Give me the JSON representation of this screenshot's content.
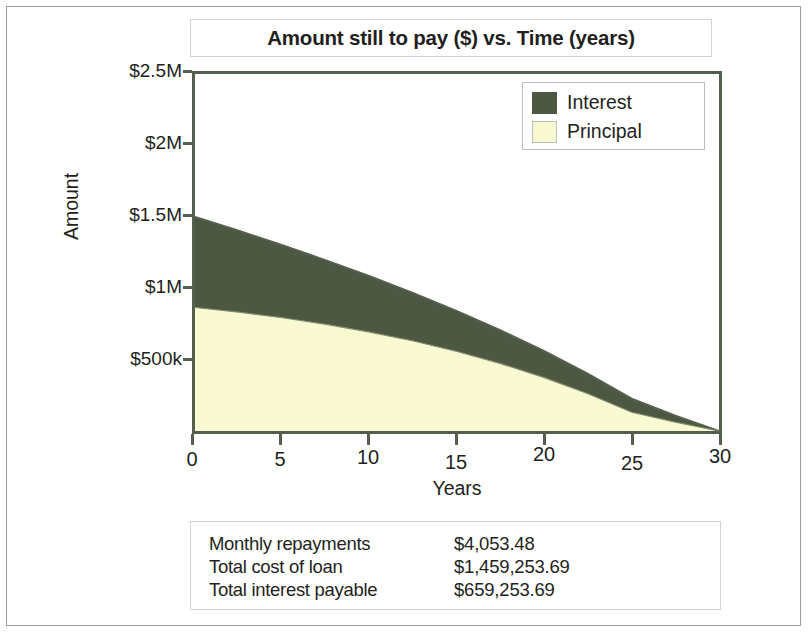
{
  "chart_data": {
    "type": "area",
    "title": "Amount still to pay ($) vs. Time (years)",
    "xlabel": "Years",
    "ylabel": "Amount",
    "xlim": [
      0,
      30
    ],
    "ylim": [
      0,
      2500000
    ],
    "grid": false,
    "stacked": true,
    "legend_position": "top-right",
    "x_ticks": [
      0,
      5,
      10,
      15,
      20,
      25,
      30
    ],
    "x_tick_labels": [
      "0",
      "5",
      "10",
      "15",
      "20",
      "25",
      "30"
    ],
    "y_ticks": [
      500000,
      1000000,
      1500000,
      2000000,
      2500000
    ],
    "y_tick_labels": [
      "$500k",
      "$1M",
      "$1.5M",
      "$2M",
      "$2.5M"
    ],
    "colors": {
      "interest": "#4c5842",
      "principal": "#fafad2",
      "axis": "#555f4d"
    },
    "x": [
      0,
      2.5,
      5,
      7.5,
      10,
      12.5,
      15,
      17.5,
      20,
      22.5,
      25,
      27.5,
      30
    ],
    "series": [
      {
        "name": "Principal",
        "values": [
          865000,
          832000,
          793000,
          747000,
          693000,
          630000,
          557000,
          472000,
          374000,
          261000,
          131000,
          62000,
          0
        ]
      },
      {
        "name": "Interest",
        "values": [
          634000,
          570000,
          508000,
          448000,
          391000,
          336000,
          283000,
          233000,
          185000,
          139000,
          95000,
          45000,
          0
        ]
      }
    ],
    "totals_stacked": [
      1499000,
      1402000,
      1301000,
      1195000,
      1084000,
      966000,
      840000,
      705000,
      559000,
      400000,
      226000,
      107000,
      0
    ]
  },
  "title_box": {
    "title": "Amount still to pay ($) vs. Time (years)"
  },
  "legend": {
    "items": [
      {
        "label": "Interest",
        "color": "#4c5842"
      },
      {
        "label": "Principal",
        "color": "#fafad2"
      }
    ]
  },
  "axes": {
    "y_title": "Amount",
    "x_title": "Years",
    "y_labels": [
      "$2.5M",
      "$2M",
      "$1.5M",
      "$1M",
      "$500k"
    ],
    "x_labels": [
      "0",
      "5",
      "10",
      "15",
      "20",
      "25",
      "30"
    ]
  },
  "summary": {
    "rows": [
      {
        "key": "Monthly repayments",
        "value": "$4,053.48"
      },
      {
        "key": "Total cost of loan",
        "value": "$1,459,253.69"
      },
      {
        "key": "Total interest payable",
        "value": "$659,253.69"
      }
    ]
  }
}
